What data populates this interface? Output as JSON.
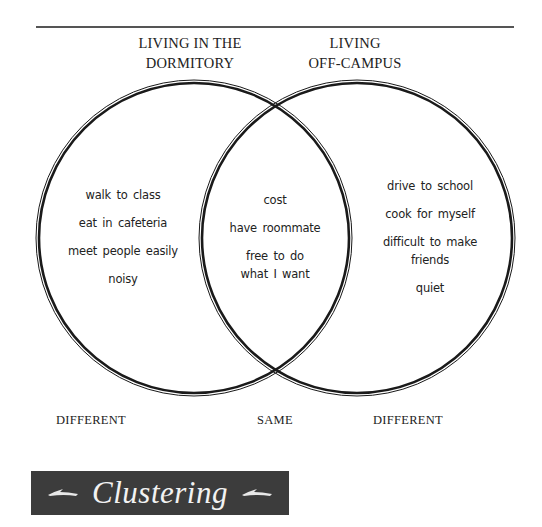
{
  "headers": {
    "left": [
      "LIVING IN THE",
      "DORMITORY"
    ],
    "right": [
      "LIVING",
      "OFF-CAMPUS"
    ]
  },
  "left_circle": {
    "items": [
      "walk to class",
      "eat in cafeteria",
      "meet people easily",
      "noisy"
    ]
  },
  "overlap": {
    "items": [
      "cost",
      "have roommate",
      "free to do",
      "what I want"
    ]
  },
  "right_circle": {
    "items": [
      "drive to school",
      "cook for myself",
      "difficult to make",
      "friends",
      "quiet"
    ]
  },
  "footers": {
    "left": "DIFFERENT",
    "middle": "SAME",
    "right": "DIFFERENT"
  },
  "banner": {
    "title": "Clustering",
    "background": "#3c3c3c",
    "text_color": "#f2f2f2"
  },
  "colors": {
    "line": "#1a1a1a",
    "rule": "#555555",
    "text": "#222222"
  }
}
